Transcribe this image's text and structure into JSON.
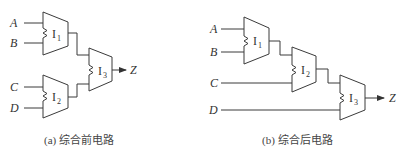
{
  "diagram_a": {
    "caption": "(a) 综合前电路",
    "inputs": [
      "A",
      "B",
      "C",
      "D"
    ],
    "output": "Z",
    "instances": [
      {
        "name": "I",
        "sub": "1"
      },
      {
        "name": "I",
        "sub": "2"
      },
      {
        "name": "I",
        "sub": "3"
      }
    ]
  },
  "diagram_b": {
    "caption": "(b) 综合后电路",
    "inputs": [
      "A",
      "B",
      "C",
      "D"
    ],
    "output": "Z",
    "instances": [
      {
        "name": "I",
        "sub": "1"
      },
      {
        "name": "I",
        "sub": "2"
      },
      {
        "name": "I",
        "sub": "3"
      }
    ]
  },
  "colors": {
    "line": "#3a3a3a",
    "text": "#333333"
  }
}
